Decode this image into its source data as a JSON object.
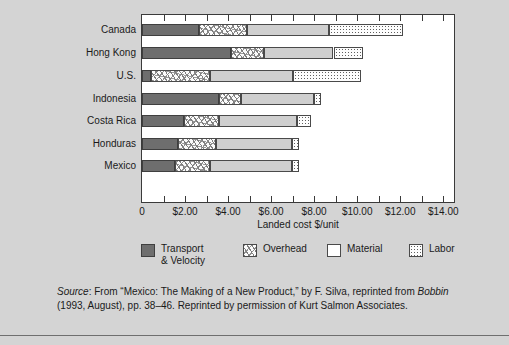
{
  "top_fragment": "",
  "axis_title": "Landed cost $/unit",
  "x_tick_labels": [
    "0",
    "$2.00",
    "$4.00",
    "$6.00",
    "$8.00",
    "$10.00",
    "$12.00",
    "$14.00"
  ],
  "x_tick_values": [
    0,
    2,
    4,
    6,
    8,
    10,
    12,
    14
  ],
  "legend": [
    {
      "label": "Transport\n& Velocity",
      "key": "transport",
      "color": "#6e6e6e"
    },
    {
      "label": "Overhead",
      "key": "overhead",
      "color": "#fbfbfb"
    },
    {
      "label": "Material",
      "key": "material",
      "color": "#cfcfcf"
    },
    {
      "label": "Labor",
      "key": "labor",
      "color": "#fdfdfd"
    }
  ],
  "source": {
    "lead": "Source",
    "text": ": From “Mexico: The Making of a New Product,” by F. Silva, reprinted from ",
    "italic2": "Bobbin",
    "text2": " (1993, August), pp. 38–46. Reprinted by permission of Kurt Salmon Associates."
  },
  "chart_data": {
    "type": "bar",
    "orientation": "horizontal",
    "stacked": true,
    "title": "",
    "xlabel": "Landed cost $/unit",
    "ylabel": "",
    "xlim": [
      0,
      14.5
    ],
    "xticks": [
      0,
      1,
      2,
      3,
      4,
      5,
      6,
      7,
      8,
      9,
      10,
      11,
      12,
      13,
      14
    ],
    "xticklabels": [
      "0",
      "",
      "$2.00",
      "",
      "$4.00",
      "",
      "$6.00",
      "",
      "$8.00",
      "",
      "$10.00",
      "",
      "$12.00",
      "",
      "$14.00"
    ],
    "grid": false,
    "legend_position": "bottom",
    "categories": [
      "Canada",
      "Hong Kong",
      "U.S.",
      "Indonesia",
      "Costa Rica",
      "Honduras",
      "Mexico"
    ],
    "series": [
      {
        "name": "Transport & Velocity",
        "values": [
          2.65,
          4.15,
          0.4,
          3.6,
          1.95,
          1.65,
          1.55
        ]
      },
      {
        "name": "Overhead",
        "values": [
          2.25,
          1.5,
          2.75,
          1.0,
          1.65,
          1.8,
          1.6
        ]
      },
      {
        "name": "Material",
        "values": [
          3.8,
          3.25,
          3.85,
          3.4,
          3.6,
          3.5,
          3.8
        ]
      },
      {
        "name": "Labor",
        "values": [
          3.45,
          1.35,
          3.2,
          0.3,
          0.65,
          0.35,
          0.35
        ]
      }
    ],
    "totals": [
      12.15,
      10.25,
      10.2,
      8.3,
      7.85,
      7.3,
      7.3
    ]
  }
}
